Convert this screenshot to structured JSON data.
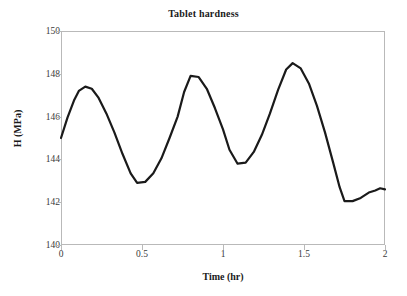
{
  "chart_data": {
    "type": "line",
    "title": "Tablet hardness",
    "xlabel": "Time (hr)",
    "ylabel": "H (MPa)",
    "xlim": [
      0,
      2
    ],
    "ylim": [
      140,
      150
    ],
    "xticks": [
      "0",
      "0.5",
      "1",
      "1.5",
      "2"
    ],
    "xtick_values": [
      0,
      0.5,
      1,
      1.5,
      2
    ],
    "yticks": [
      "140",
      "142",
      "144",
      "146",
      "148",
      "150"
    ],
    "ytick_values": [
      140,
      142,
      144,
      146,
      148,
      150
    ],
    "grid": false,
    "legend": false,
    "series": [
      {
        "name": "Tablet hardness",
        "color": "#1a1a1a",
        "line_width": 2.2,
        "x": [
          0.0,
          0.04,
          0.08,
          0.11,
          0.15,
          0.19,
          0.23,
          0.28,
          0.33,
          0.38,
          0.43,
          0.47,
          0.52,
          0.57,
          0.62,
          0.67,
          0.72,
          0.76,
          0.8,
          0.85,
          0.9,
          0.95,
          1.0,
          1.04,
          1.09,
          1.14,
          1.19,
          1.24,
          1.29,
          1.34,
          1.39,
          1.43,
          1.48,
          1.53,
          1.58,
          1.63,
          1.68,
          1.72,
          1.75,
          1.8,
          1.85,
          1.9,
          1.94,
          1.97,
          2.0
        ],
        "y": [
          145.0,
          145.95,
          146.75,
          147.2,
          147.4,
          147.3,
          146.9,
          146.15,
          145.25,
          144.25,
          143.35,
          142.9,
          142.95,
          143.35,
          144.05,
          145.0,
          146.0,
          147.15,
          147.9,
          147.85,
          147.3,
          146.4,
          145.4,
          144.45,
          143.8,
          143.85,
          144.35,
          145.15,
          146.15,
          147.25,
          148.2,
          148.5,
          148.25,
          147.55,
          146.5,
          145.25,
          143.85,
          142.7,
          142.05,
          142.05,
          142.2,
          142.45,
          142.55,
          142.65,
          142.6
        ]
      }
    ]
  }
}
